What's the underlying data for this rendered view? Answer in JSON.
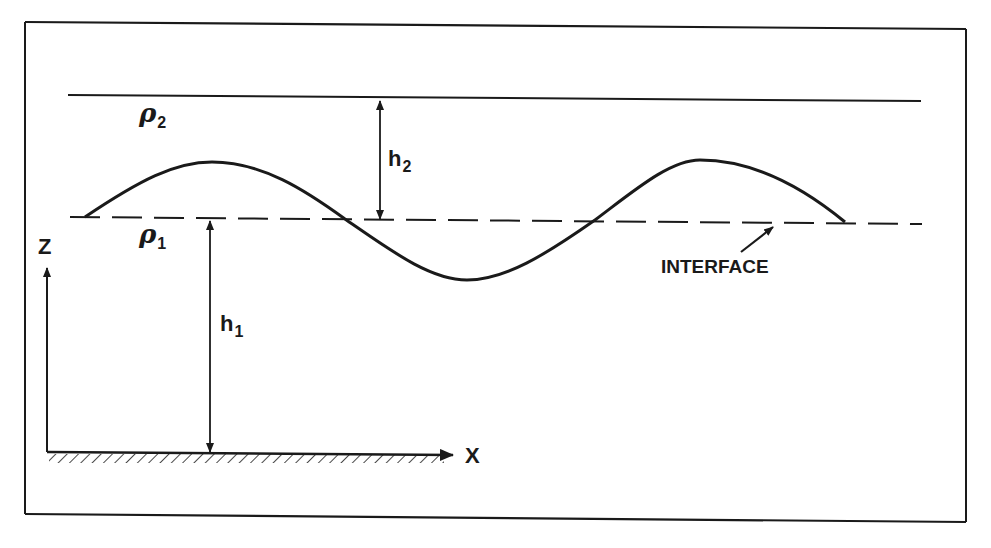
{
  "diagram": {
    "labels": {
      "upper_density": {
        "symbol": "ρ",
        "subscript": "2"
      },
      "lower_density": {
        "symbol": "ρ",
        "subscript": "1"
      },
      "upper_thickness": {
        "symbol": "h",
        "subscript": "2"
      },
      "lower_thickness": {
        "symbol": "h",
        "subscript": "1"
      },
      "z_axis": "Z",
      "x_axis": "X",
      "interface": "INTERFACE"
    },
    "elements": [
      "outer-frame",
      "upper-boundary-line",
      "dashed-interface-line",
      "sinusoidal-interface-wave",
      "h2-double-arrow",
      "h1-double-arrow",
      "z-axis-arrow",
      "x-axis-arrow",
      "hatched-bottom-boundary",
      "interface-pointer-arrow"
    ],
    "colors": {
      "ink": "#1a1a1a",
      "background": "#ffffff"
    }
  }
}
